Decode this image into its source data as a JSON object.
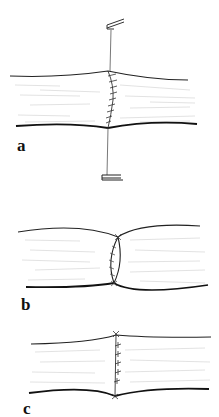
{
  "figure": {
    "panels": [
      {
        "id": "a",
        "label": "a",
        "contents": "vessel segment with running suture line and traction stay sutures held by clamps above and below"
      },
      {
        "id": "b",
        "label": "b",
        "contents": "vessel ends approximated with suture line, narrowed waist at junction"
      },
      {
        "id": "c",
        "label": "c",
        "contents": "completed anastomosis with interrupted sutures"
      }
    ]
  },
  "colors": {
    "ink": "#1a1a1a",
    "hatching": "#c8c8c8",
    "background": "#ffffff"
  }
}
